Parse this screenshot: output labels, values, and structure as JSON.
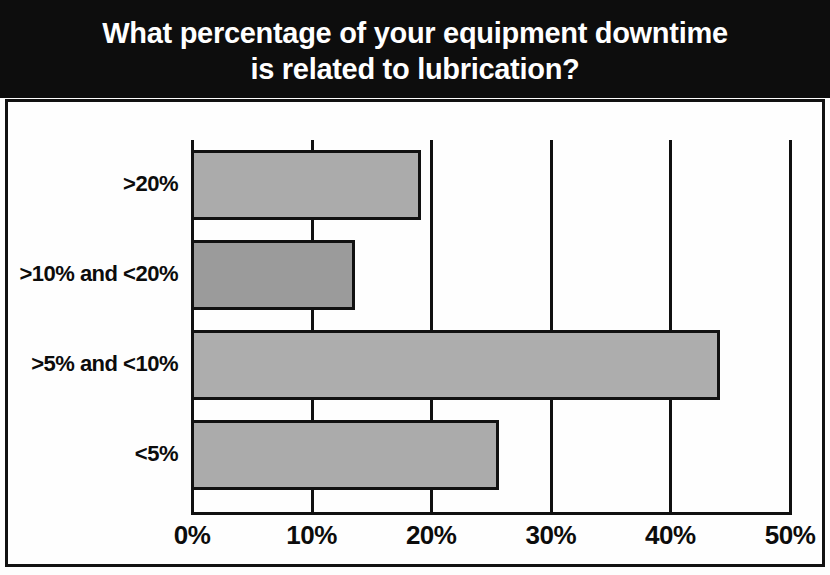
{
  "chart_data": {
    "type": "bar",
    "orientation": "horizontal",
    "title": "What percentage of your equipment downtime is related to lubrication?",
    "title_lines": [
      "What percentage of your equipment downtime",
      "is related to lubrication?"
    ],
    "categories": [
      ">20%",
      ">10% and <20%",
      ">5% and <10%",
      "<5%"
    ],
    "values": [
      19,
      13.5,
      44,
      25.5
    ],
    "xlabel": "",
    "ylabel": "",
    "xlim": [
      0,
      50
    ],
    "xticks": [
      0,
      10,
      20,
      30,
      40,
      50
    ],
    "xtick_labels": [
      "0%",
      "10%",
      "20%",
      "30%",
      "40%",
      "50%"
    ],
    "grid": true,
    "grid_axis": "x",
    "legend": false,
    "bar_colors": [
      "#ababab",
      "#9b9b9b",
      "#adadad",
      "#ababab"
    ],
    "bar_edge_color": "#111111",
    "title_background": "#0d0d0d",
    "title_color": "#ffffff",
    "axis_color": "#101010",
    "plot_background": "#fefefe"
  }
}
